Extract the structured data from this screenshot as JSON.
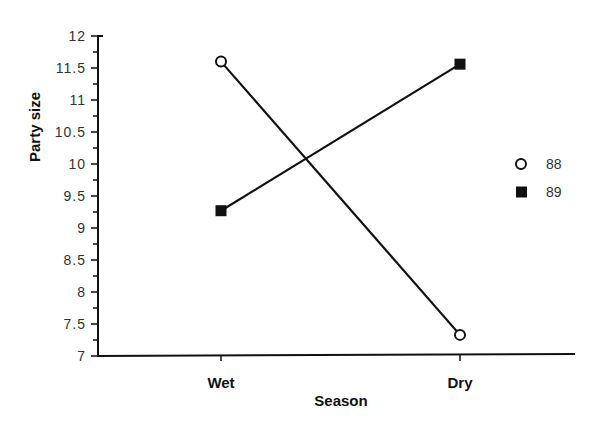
{
  "chart_data": {
    "type": "line",
    "title": "",
    "xlabel": "Season",
    "ylabel": "Party size",
    "categories": [
      "Wet",
      "Dry"
    ],
    "series": [
      {
        "name": "88",
        "marker": "open-circle",
        "values": [
          11.6,
          7.33
        ]
      },
      {
        "name": "89",
        "marker": "filled-square",
        "values": [
          9.27,
          11.56
        ]
      }
    ],
    "ylim": [
      7,
      12
    ],
    "yticks": [
      "7",
      "7.5",
      "8",
      "8.5",
      "9",
      "9.5",
      "10",
      "10.5",
      "11",
      "11.5",
      "12"
    ],
    "grid": false,
    "legend_position": "right"
  },
  "axes": {
    "x_title": "Season",
    "y_title": "Party size"
  },
  "legend": {
    "items": [
      {
        "label": "88",
        "marker": "open-circle"
      },
      {
        "label": "89",
        "marker": "filled-square"
      }
    ]
  },
  "colors": {
    "line": "#111111",
    "axis": "#111111",
    "background": "#ffffff"
  }
}
